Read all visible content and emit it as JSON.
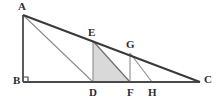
{
  "figure": {
    "canvas": {
      "width": 219,
      "height": 101
    },
    "colors": {
      "outline": "#3a3a3a",
      "inner_line": "#8c8c8c",
      "shade_fill": "#d9d9d9",
      "label_text": "#2e2e2e",
      "background": "#ffffff"
    },
    "points": [
      {
        "name": "A",
        "label": "A",
        "x": 23,
        "y": 15,
        "label_x": 18,
        "label_y": 1
      },
      {
        "name": "B",
        "label": "B",
        "x": 23,
        "y": 82,
        "label_x": 13,
        "label_y": 75
      },
      {
        "name": "C",
        "label": "C",
        "x": 200,
        "y": 82,
        "label_x": 204,
        "label_y": 74
      },
      {
        "name": "D",
        "label": "D",
        "x": 93,
        "y": 82,
        "label_x": 89,
        "label_y": 87
      },
      {
        "name": "E",
        "label": "E",
        "x": 93,
        "y": 41,
        "label_x": 88,
        "label_y": 27
      },
      {
        "name": "F",
        "label": "F",
        "x": 130,
        "y": 82,
        "label_x": 127,
        "label_y": 87
      },
      {
        "name": "G",
        "label": "G",
        "x": 130,
        "y": 53,
        "label_x": 126,
        "label_y": 39
      },
      {
        "name": "H",
        "label": "H",
        "x": 152,
        "y": 82,
        "label_x": 148,
        "label_y": 87
      }
    ],
    "segments": [
      {
        "name": "side-AB",
        "from": "A",
        "to": "B",
        "style": "outline"
      },
      {
        "name": "side-BC",
        "from": "B",
        "to": "C",
        "style": "outline"
      },
      {
        "name": "hypotenuse-AC",
        "from": "A",
        "to": "C",
        "style": "outline"
      },
      {
        "name": "cevian-AD",
        "from": "A",
        "to": "D",
        "style": "inner"
      },
      {
        "name": "altitude-ED",
        "from": "E",
        "to": "D",
        "style": "inner"
      },
      {
        "name": "cevian-EF",
        "from": "E",
        "to": "F",
        "style": "inner"
      },
      {
        "name": "altitude-GF",
        "from": "G",
        "to": "F",
        "style": "inner"
      },
      {
        "name": "cevian-GH",
        "from": "G",
        "to": "H",
        "style": "inner"
      }
    ],
    "shaded_region": {
      "name": "triangle-EDF",
      "vertices": [
        "E",
        "D",
        "F"
      ],
      "fill": "#d9d9d9"
    },
    "right_angle_marker": {
      "name": "right-angle-at-B",
      "at": "B",
      "size": 5
    }
  }
}
